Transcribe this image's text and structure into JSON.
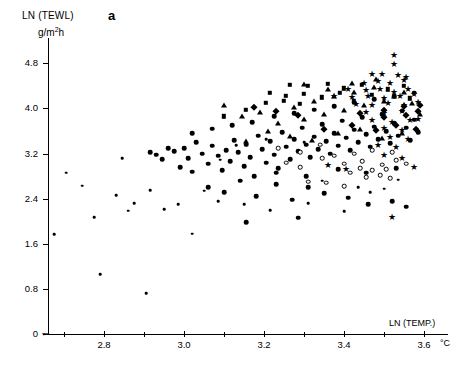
{
  "chart_data": {
    "type": "scatter",
    "title": "",
    "panel_label": "a",
    "ylabel": "LN (TEWL)",
    "yunit": "g/m²h",
    "xlabel": "LN (TEMP.)",
    "xunit": "°C",
    "xlim": [
      2.66,
      3.66
    ],
    "ylim": [
      0,
      5.25
    ],
    "grid": false,
    "legend": "none",
    "axis_break": true,
    "yticks": [
      0,
      0.8,
      1.6,
      2.4,
      3.2,
      4.0,
      4.8
    ],
    "ytick_labels": [
      "0",
      "0.8",
      "1.6",
      "2.4",
      "3.2",
      "4.0",
      "4.8"
    ],
    "xticks": [
      2.7,
      2.8,
      2.9,
      3.0,
      3.1,
      3.2,
      3.3,
      3.4,
      3.5,
      3.6
    ],
    "xtick_labels": [
      "",
      "2.8",
      "",
      "3.0",
      "",
      "3.2",
      "",
      "3.4",
      "",
      "3.6"
    ],
    "xtick_major": [
      2.8,
      3.0,
      3.2,
      3.4,
      3.6
    ],
    "series": [
      {
        "name": "small-dot",
        "marker": "dot",
        "size": 2.6,
        "points": [
          [
            2.675,
            1.77
          ],
          [
            2.705,
            2.86
          ],
          [
            2.745,
            2.63
          ],
          [
            2.775,
            2.07
          ],
          [
            2.79,
            1.06
          ],
          [
            2.83,
            2.46
          ],
          [
            2.845,
            3.12
          ],
          [
            2.86,
            2.19
          ],
          [
            2.875,
            2.32
          ],
          [
            2.905,
            0.72
          ],
          [
            2.915,
            2.55
          ],
          [
            2.95,
            2.21
          ],
          [
            2.985,
            2.3
          ],
          [
            3.02,
            1.78
          ],
          [
            3.05,
            2.54
          ],
          [
            3.085,
            2.36
          ],
          [
            3.15,
            2.3
          ],
          [
            3.215,
            2.2
          ],
          [
            3.31,
            2.32
          ],
          [
            3.4,
            2.18
          ],
          [
            3.09,
            3.09
          ],
          [
            3.13,
            3.35
          ],
          [
            3.205,
            3.45
          ],
          [
            3.3,
            3.4
          ],
          [
            3.345,
            2.72
          ],
          [
            3.435,
            2.6
          ],
          [
            3.465,
            2.52
          ],
          [
            3.5,
            2.58
          ],
          [
            3.535,
            2.74
          ]
        ]
      },
      {
        "name": "filled-circle",
        "marker": "circle",
        "size": 4.6,
        "points": [
          [
            2.915,
            3.22
          ],
          [
            2.93,
            3.18
          ],
          [
            2.945,
            3.1
          ],
          [
            2.96,
            3.3
          ],
          [
            2.975,
            3.24
          ],
          [
            2.99,
            2.96
          ],
          [
            3.0,
            3.3
          ],
          [
            3.01,
            3.12
          ],
          [
            3.02,
            2.88
          ],
          [
            3.03,
            3.4
          ],
          [
            3.045,
            3.2
          ],
          [
            3.06,
            3.02
          ],
          [
            3.07,
            3.34
          ],
          [
            3.085,
            3.16
          ],
          [
            3.095,
            2.9
          ],
          [
            3.105,
            3.26
          ],
          [
            3.115,
            3.06
          ],
          [
            3.125,
            3.44
          ],
          [
            3.135,
            3.22
          ],
          [
            3.15,
            2.98
          ],
          [
            3.155,
            3.36
          ],
          [
            3.165,
            3.14
          ],
          [
            3.175,
            2.8
          ],
          [
            3.185,
            3.52
          ],
          [
            3.195,
            3.28
          ],
          [
            3.205,
            3.04
          ],
          [
            3.215,
            3.42
          ],
          [
            3.225,
            3.18
          ],
          [
            3.235,
            2.94
          ],
          [
            3.245,
            3.58
          ],
          [
            3.255,
            3.32
          ],
          [
            3.265,
            3.1
          ],
          [
            3.275,
            3.46
          ],
          [
            3.285,
            3.24
          ],
          [
            3.295,
            3.66
          ],
          [
            3.305,
            3.36
          ],
          [
            3.315,
            3.14
          ],
          [
            3.325,
            3.5
          ],
          [
            3.335,
            3.28
          ],
          [
            3.345,
            3.72
          ],
          [
            3.355,
            3.42
          ],
          [
            3.365,
            3.2
          ],
          [
            3.375,
            3.56
          ],
          [
            3.385,
            3.34
          ],
          [
            3.395,
            3.78
          ],
          [
            3.405,
            3.48
          ],
          [
            3.415,
            3.26
          ],
          [
            3.425,
            3.62
          ],
          [
            3.435,
            3.4
          ],
          [
            3.445,
            3.84
          ],
          [
            3.455,
            3.54
          ],
          [
            3.465,
            3.32
          ],
          [
            3.475,
            3.68
          ],
          [
            3.485,
            3.46
          ],
          [
            3.495,
            3.9
          ],
          [
            3.505,
            3.6
          ],
          [
            3.515,
            3.38
          ],
          [
            3.525,
            3.74
          ],
          [
            3.535,
            3.52
          ],
          [
            3.545,
            3.96
          ],
          [
            3.555,
            3.66
          ],
          [
            3.565,
            3.44
          ],
          [
            3.575,
            3.8
          ],
          [
            3.585,
            3.58
          ],
          [
            3.06,
            2.6
          ],
          [
            3.1,
            2.52
          ],
          [
            3.14,
            2.72
          ],
          [
            3.18,
            2.44
          ],
          [
            3.23,
            2.66
          ],
          [
            3.27,
            2.38
          ],
          [
            3.31,
            2.6
          ],
          [
            3.35,
            2.5
          ],
          [
            3.41,
            2.42
          ],
          [
            3.46,
            2.3
          ],
          [
            3.52,
            2.36
          ],
          [
            3.555,
            2.26
          ],
          [
            3.285,
            2.06
          ],
          [
            3.155,
            1.98
          ],
          [
            3.02,
            3.56
          ],
          [
            3.07,
            3.64
          ],
          [
            3.12,
            3.7
          ],
          [
            3.17,
            3.76
          ],
          [
            3.225,
            3.86
          ],
          [
            3.275,
            3.92
          ],
          [
            3.325,
            3.98
          ],
          [
            3.375,
            4.04
          ],
          [
            3.425,
            4.1
          ],
          [
            3.475,
            4.16
          ],
          [
            3.525,
            4.22
          ],
          [
            3.575,
            4.28
          ],
          [
            3.23,
            2.86
          ],
          [
            3.305,
            2.8
          ],
          [
            3.385,
            2.92
          ],
          [
            3.455,
            2.86
          ],
          [
            3.53,
            2.94
          ]
        ]
      },
      {
        "name": "open-circle",
        "marker": "open",
        "size": 4.6,
        "points": [
          [
            3.235,
            3.3
          ],
          [
            3.29,
            3.22
          ],
          [
            3.345,
            3.12
          ],
          [
            3.4,
            3.02
          ],
          [
            3.415,
            2.86
          ],
          [
            3.44,
            2.94
          ],
          [
            3.455,
            2.78
          ],
          [
            3.47,
            2.9
          ],
          [
            3.49,
            2.82
          ],
          [
            3.505,
            2.92
          ],
          [
            3.515,
            2.76
          ],
          [
            3.355,
            2.68
          ],
          [
            3.4,
            2.62
          ],
          [
            3.31,
            2.7
          ],
          [
            3.255,
            3.04
          ],
          [
            3.445,
            3.06
          ],
          [
            3.495,
            3.0
          ],
          [
            3.53,
            3.08
          ],
          [
            3.375,
            3.16
          ],
          [
            3.29,
            2.96
          ],
          [
            3.47,
            3.26
          ],
          [
            3.425,
            3.2
          ],
          [
            3.52,
            3.22
          ],
          [
            3.555,
            3.02
          ],
          [
            3.34,
            3.36
          ]
        ]
      },
      {
        "name": "triangle",
        "marker": "triangle",
        "size": 5.4,
        "points": [
          [
            3.1,
            4.06
          ],
          [
            3.145,
            3.86
          ],
          [
            3.19,
            3.94
          ],
          [
            3.235,
            3.74
          ],
          [
            3.275,
            4.02
          ],
          [
            3.3,
            3.82
          ],
          [
            3.325,
            4.14
          ],
          [
            3.35,
            3.9
          ],
          [
            3.375,
            4.22
          ],
          [
            3.4,
            3.98
          ],
          [
            3.425,
            4.3
          ],
          [
            3.45,
            4.06
          ],
          [
            3.475,
            4.38
          ],
          [
            3.5,
            4.14
          ],
          [
            3.525,
            4.22
          ],
          [
            3.55,
            4.3
          ],
          [
            3.57,
            4.1
          ],
          [
            3.21,
            3.6
          ],
          [
            3.265,
            3.52
          ],
          [
            3.32,
            3.44
          ],
          [
            3.385,
            3.56
          ],
          [
            3.44,
            3.64
          ],
          [
            3.495,
            3.48
          ],
          [
            3.545,
            3.56
          ],
          [
            3.155,
            3.42
          ],
          [
            3.59,
            3.9
          ],
          [
            3.3,
            4.44
          ],
          [
            3.36,
            4.34
          ],
          [
            3.42,
            4.46
          ],
          [
            3.48,
            4.52
          ]
        ]
      },
      {
        "name": "square",
        "marker": "square",
        "size": 4.4,
        "points": [
          [
            3.265,
            4.42
          ],
          [
            3.31,
            4.4
          ],
          [
            3.36,
            4.44
          ],
          [
            3.4,
            4.36
          ],
          [
            3.445,
            4.42
          ],
          [
            3.215,
            4.28
          ],
          [
            3.255,
            4.22
          ],
          [
            3.3,
            4.26
          ],
          [
            3.345,
            4.2
          ],
          [
            3.39,
            4.28
          ],
          [
            3.205,
            4.1
          ],
          [
            3.25,
            4.14
          ],
          [
            3.155,
            3.98
          ],
          [
            3.1,
            3.86
          ],
          [
            3.425,
            4.14
          ],
          [
            3.47,
            4.24
          ],
          [
            3.51,
            4.34
          ],
          [
            3.55,
            4.4
          ],
          [
            3.565,
            4.18
          ],
          [
            3.29,
            4.08
          ]
        ]
      },
      {
        "name": "diamond",
        "marker": "diamond",
        "size": 4.6,
        "points": [
          [
            3.175,
            4.02
          ],
          [
            3.23,
            3.96
          ],
          [
            3.285,
            3.88
          ],
          [
            3.44,
            3.92
          ],
          [
            3.5,
            3.98
          ],
          [
            3.55,
            4.04
          ],
          [
            3.585,
            3.96
          ],
          [
            3.5,
            3.84
          ],
          [
            3.555,
            3.88
          ],
          [
            3.59,
            4.06
          ],
          [
            3.35,
            3.64
          ],
          [
            3.42,
            3.7
          ],
          [
            3.48,
            3.62
          ],
          [
            3.53,
            3.7
          ],
          [
            3.58,
            3.64
          ]
        ]
      },
      {
        "name": "star",
        "marker": "star",
        "size": 9,
        "points": [
          [
            3.525,
            4.94
          ],
          [
            3.525,
            4.78
          ],
          [
            3.495,
            4.62
          ],
          [
            3.47,
            4.62
          ],
          [
            3.535,
            4.6
          ],
          [
            3.555,
            4.56
          ],
          [
            3.45,
            4.46
          ],
          [
            3.485,
            4.48
          ],
          [
            3.515,
            4.46
          ],
          [
            3.55,
            4.5
          ],
          [
            3.41,
            4.34
          ],
          [
            3.455,
            4.32
          ],
          [
            3.49,
            4.34
          ],
          [
            3.525,
            4.3
          ],
          [
            3.56,
            4.34
          ],
          [
            3.375,
            4.22
          ],
          [
            3.42,
            4.2
          ],
          [
            3.46,
            4.22
          ],
          [
            3.5,
            4.18
          ],
          [
            3.54,
            4.22
          ],
          [
            3.575,
            4.26
          ],
          [
            3.43,
            4.08
          ],
          [
            3.47,
            4.06
          ],
          [
            3.51,
            4.1
          ],
          [
            3.55,
            4.06
          ],
          [
            3.585,
            4.12
          ],
          [
            3.455,
            3.94
          ],
          [
            3.5,
            3.92
          ],
          [
            3.545,
            3.96
          ],
          [
            3.585,
            3.82
          ],
          [
            3.47,
            3.8
          ],
          [
            3.52,
            3.76
          ],
          [
            3.565,
            3.8
          ],
          [
            3.5,
            3.66
          ],
          [
            3.545,
            3.62
          ],
          [
            3.515,
            3.5
          ],
          [
            3.56,
            3.46
          ],
          [
            3.485,
            3.36
          ],
          [
            3.53,
            3.32
          ],
          [
            3.5,
            3.18
          ],
          [
            3.545,
            3.12
          ],
          [
            3.575,
            2.96
          ],
          [
            3.52,
            2.08
          ],
          [
            3.405,
            2.92
          ],
          [
            3.36,
            3.0
          ]
        ]
      }
    ]
  }
}
